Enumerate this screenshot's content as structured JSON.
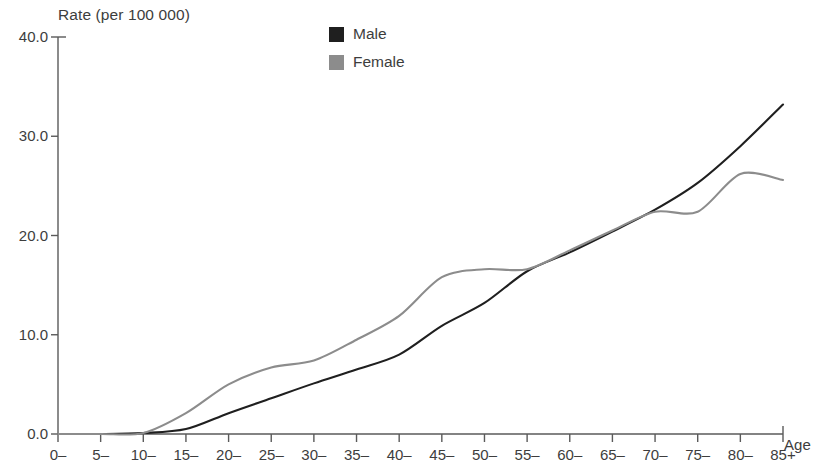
{
  "chart_data": {
    "type": "line",
    "title": "",
    "ylabel": "Rate (per 100 000)",
    "xlabel": "Age",
    "ylim": [
      0.0,
      40.0
    ],
    "y_ticks": [
      "0.0",
      "10.0",
      "20.0",
      "30.0",
      "40.0"
    ],
    "y_tick_values": [
      0.0,
      10.0,
      20.0,
      30.0,
      40.0
    ],
    "grid": false,
    "legend_position": "top-center",
    "categories": [
      "0–",
      "5–",
      "10–",
      "15–",
      "20–",
      "25–",
      "30–",
      "35–",
      "40–",
      "45–",
      "50–",
      "55–",
      "60–",
      "65–",
      "70–",
      "75–",
      "80–",
      "85+"
    ],
    "series": [
      {
        "name": "Male",
        "color": "#1f1f1f",
        "values": [
          0.0,
          0.0,
          0.1,
          0.5,
          2.1,
          3.6,
          5.1,
          6.5,
          8.0,
          10.9,
          13.2,
          16.4,
          18.3,
          20.4,
          22.6,
          25.3,
          29.0,
          33.2
        ]
      },
      {
        "name": "Female",
        "color": "#8c8c8c",
        "values": [
          0.0,
          0.0,
          0.1,
          2.1,
          5.0,
          6.7,
          7.4,
          9.5,
          11.9,
          15.8,
          16.6,
          16.6,
          18.5,
          20.5,
          22.4,
          22.4,
          26.2,
          25.6
        ]
      }
    ]
  },
  "legend": {
    "items": [
      {
        "label": "Male",
        "color": "#1f1f1f"
      },
      {
        "label": "Female",
        "color": "#8c8c8c"
      }
    ]
  },
  "axes": {
    "y_title": "Rate (per 100 000)",
    "x_title": "Age",
    "axis_color": "#5a5a5a"
  }
}
